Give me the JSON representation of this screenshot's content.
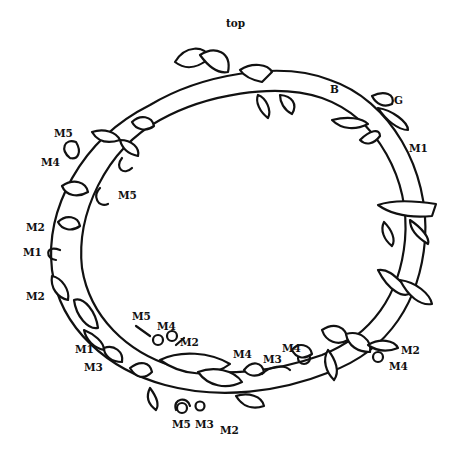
{
  "diagram": {
    "type": "wreath-line-drawing",
    "labels": [
      {
        "id": "top",
        "text": "top",
        "x": 226,
        "y": 26
      },
      {
        "id": "B",
        "text": "B",
        "x": 330,
        "y": 87
      },
      {
        "id": "G",
        "text": "G",
        "x": 394,
        "y": 96
      },
      {
        "id": "M1_r",
        "text": "M1",
        "x": 409,
        "y": 144
      },
      {
        "id": "M5_a",
        "text": "M5",
        "x": 54,
        "y": 130
      },
      {
        "id": "M4_a",
        "text": "M4",
        "x": 41,
        "y": 158
      },
      {
        "id": "M5_b",
        "text": "M5",
        "x": 118,
        "y": 191
      },
      {
        "id": "M2_a",
        "text": "M2",
        "x": 26,
        "y": 224
      },
      {
        "id": "M1_a",
        "text": "M1",
        "x": 23,
        "y": 248
      },
      {
        "id": "M2_b",
        "text": "M2",
        "x": 26,
        "y": 292
      },
      {
        "id": "M5_c",
        "text": "M5",
        "x": 132,
        "y": 313
      },
      {
        "id": "M4_b",
        "text": "M4",
        "x": 157,
        "y": 322
      },
      {
        "id": "M2_c",
        "text": "M2",
        "x": 180,
        "y": 337
      },
      {
        "id": "M1_b",
        "text": "M1",
        "x": 75,
        "y": 345
      },
      {
        "id": "M3_a",
        "text": "M3",
        "x": 84,
        "y": 363
      },
      {
        "id": "M4_c",
        "text": "M4",
        "x": 233,
        "y": 350
      },
      {
        "id": "M3_b",
        "text": "M3",
        "x": 263,
        "y": 355
      },
      {
        "id": "M4_d",
        "text": "M4",
        "x": 282,
        "y": 343
      },
      {
        "id": "M2_d",
        "text": "M2",
        "x": 401,
        "y": 346
      },
      {
        "id": "M4_e",
        "text": "M4",
        "x": 389,
        "y": 362
      },
      {
        "id": "M5_d",
        "text": "M5",
        "x": 172,
        "y": 420
      },
      {
        "id": "M3_c",
        "text": "M3",
        "x": 195,
        "y": 420
      },
      {
        "id": "M2_e",
        "text": "M2",
        "x": 220,
        "y": 426
      }
    ],
    "colors": {
      "line": "#111111",
      "background": "#ffffff"
    }
  }
}
